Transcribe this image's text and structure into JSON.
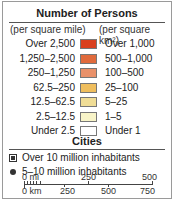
{
  "legend": {
    "title": "Number of Persons",
    "col_headers": {
      "mile": "(per square mile)",
      "km": "(per square km²)"
    },
    "rows": [
      {
        "mi": "Over 2,500",
        "km": "Over 1,000",
        "color": "#d9401e"
      },
      {
        "mi": "1,250–2,500",
        "km": "500–1,000",
        "color": "#e06a3c"
      },
      {
        "mi": "250–1,250",
        "km": "100–500",
        "color": "#e9916a"
      },
      {
        "mi": "62.5–250",
        "km": "25–100",
        "color": "#efbe5e"
      },
      {
        "mi": "12.5–62.5",
        "km": "5–25",
        "color": "#f0dd96"
      },
      {
        "mi": "2.5–12.5",
        "km": "1–5",
        "color": "#f8f4c8"
      },
      {
        "mi": "Under 2.5",
        "km": "Under 1",
        "color": "#ffffff"
      }
    ]
  },
  "cities": {
    "title": "Cities",
    "items": [
      {
        "symbol": "square",
        "label": "Over 10 million inhabitants"
      },
      {
        "symbol": "dot",
        "label": "5–10 million inhabitants"
      }
    ]
  },
  "scale": {
    "mi_labels": [
      "0 mi",
      "250",
      "500"
    ],
    "km_labels": [
      "0 km",
      "250",
      "500",
      "750"
    ]
  }
}
